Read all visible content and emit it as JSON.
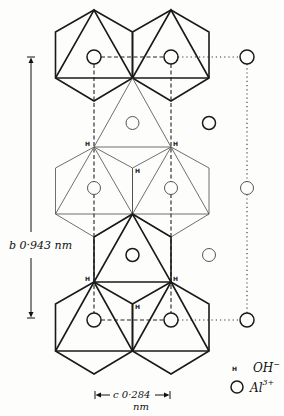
{
  "figure": {
    "atom_labels": {
      "hydroxyl": "H"
    },
    "dimension_b": {
      "axis": "b",
      "value": "0·943",
      "unit": "nm"
    },
    "dimension_c": {
      "axis": "c",
      "value": "0·284",
      "unit": "nm"
    },
    "legend": [
      {
        "symbol": "H",
        "label_base": "OH",
        "label_sup": "−"
      },
      {
        "symbol": "circle",
        "label_base": "Al",
        "label_sup": "3+"
      }
    ]
  }
}
